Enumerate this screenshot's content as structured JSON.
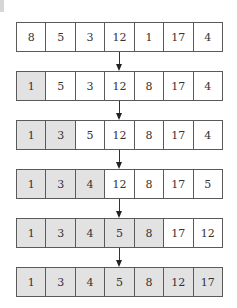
{
  "diagram": {
    "colors": {
      "sorted_fill": "#e2e2e2",
      "unsorted_fill": "#ffffff",
      "border": "#5a5a5a"
    },
    "rows": [
      {
        "values": [
          "8",
          "5",
          "3",
          "12",
          "1",
          "17",
          "4"
        ],
        "sorted_count": 0
      },
      {
        "values": [
          "1",
          "5",
          "3",
          "12",
          "8",
          "17",
          "4"
        ],
        "sorted_count": 1
      },
      {
        "values": [
          "1",
          "3",
          "5",
          "12",
          "8",
          "17",
          "4"
        ],
        "sorted_count": 2
      },
      {
        "values": [
          "1",
          "3",
          "4",
          "12",
          "8",
          "17",
          "5"
        ],
        "sorted_count": 3
      },
      {
        "values": [
          "1",
          "3",
          "4",
          "5",
          "8",
          "17",
          "12"
        ],
        "sorted_count": 5
      },
      {
        "values": [
          "1",
          "3",
          "4",
          "5",
          "8",
          "12",
          "17"
        ],
        "sorted_count": 7
      }
    ]
  }
}
